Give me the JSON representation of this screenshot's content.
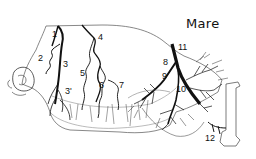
{
  "diagram": {
    "title": "Mare",
    "title_pos": {
      "x": 186,
      "y": 17
    },
    "colors": {
      "ink": "#111111",
      "outline": "#555555",
      "background": "#ffffff"
    },
    "labels": [
      {
        "id": "1",
        "text": "1",
        "x": 52,
        "y": 30
      },
      {
        "id": "2",
        "text": "2",
        "x": 38,
        "y": 54
      },
      {
        "id": "3",
        "text": "3",
        "x": 62,
        "y": 61
      },
      {
        "id": "3p",
        "text": "3'",
        "x": 65,
        "y": 87
      },
      {
        "id": "4",
        "text": "4",
        "x": 98,
        "y": 33
      },
      {
        "id": "5",
        "text": "5",
        "x": 80,
        "y": 69
      },
      {
        "id": "6",
        "text": "6",
        "x": 99,
        "y": 81
      },
      {
        "id": "7",
        "text": "7",
        "x": 119,
        "y": 81
      },
      {
        "id": "8",
        "text": "8",
        "x": 163,
        "y": 58
      },
      {
        "id": "9",
        "text": "9",
        "x": 162,
        "y": 72
      },
      {
        "id": "10",
        "text": "10",
        "x": 176,
        "y": 85
      },
      {
        "id": "11",
        "text": "11",
        "x": 177,
        "y": 43
      },
      {
        "id": "12",
        "text": "12",
        "x": 205,
        "y": 134
      }
    ]
  }
}
